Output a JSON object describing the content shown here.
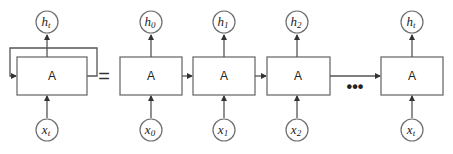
{
  "diagram": {
    "folded": {
      "cell_label": "A",
      "input": {
        "base": "x",
        "sub": "t"
      },
      "output": {
        "base": "h",
        "sub": "t"
      }
    },
    "equals": "=",
    "unrolled": [
      {
        "cell_label": "A",
        "input": {
          "base": "x",
          "sub": "0"
        },
        "output": {
          "base": "h",
          "sub": "0"
        }
      },
      {
        "cell_label": "A",
        "input": {
          "base": "x",
          "sub": "1"
        },
        "output": {
          "base": "h",
          "sub": "1"
        }
      },
      {
        "cell_label": "A",
        "input": {
          "base": "x",
          "sub": "2"
        },
        "output": {
          "base": "h",
          "sub": "2"
        }
      },
      {
        "cell_label": "A",
        "input": {
          "base": "x",
          "sub": "t"
        },
        "output": {
          "base": "h",
          "sub": "t"
        }
      }
    ],
    "ellipsis": "•••"
  }
}
